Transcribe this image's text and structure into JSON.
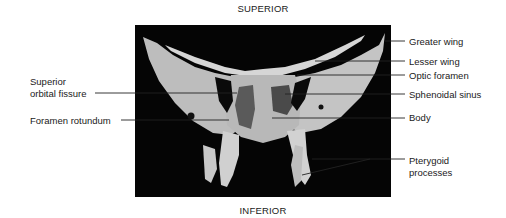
{
  "orientation": {
    "top": "SUPERIOR",
    "bottom": "INFERIOR"
  },
  "figure": {
    "background_color": "#050505",
    "bone_color": "#cfcfcf"
  },
  "labels": {
    "right": [
      {
        "text": "Greater wing"
      },
      {
        "text": "Lesser wing"
      },
      {
        "text": "Optic foramen"
      },
      {
        "text": "Sphenoidal sinus"
      },
      {
        "text": "Body"
      },
      {
        "text": "Pterygoid\nprocesses",
        "line1": "Pterygoid",
        "line2": "processes"
      }
    ],
    "left": [
      {
        "text": "Superior orbital fissure",
        "line1": "Superior",
        "line2": "orbital fissure"
      },
      {
        "text": "Foramen rotundum"
      }
    ]
  }
}
